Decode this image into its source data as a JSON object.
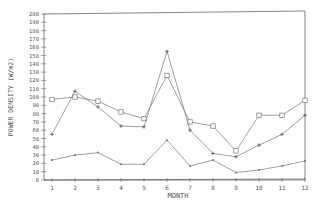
{
  "chart_data": {
    "type": "line",
    "title": "",
    "xlabel": "MONTH",
    "ylabel": "POWER DENSITY (W/m2)",
    "x": [
      1,
      2,
      3,
      4,
      5,
      6,
      7,
      8,
      9,
      10,
      11,
      12
    ],
    "xlim": [
      1,
      12
    ],
    "ylim": [
      0,
      200
    ],
    "yticks": [
      0,
      10,
      20,
      30,
      40,
      50,
      60,
      70,
      80,
      90,
      100,
      110,
      120,
      130,
      140,
      150,
      160,
      170,
      180,
      190,
      200
    ],
    "xticks": [
      1,
      2,
      3,
      4,
      5,
      6,
      7,
      8,
      9,
      10,
      11,
      12
    ],
    "grid": false,
    "legend": null,
    "series": [
      {
        "name": "Series A (square markers)",
        "marker": "square",
        "values": [
          97,
          100,
          95,
          82,
          74,
          126,
          70,
          65,
          35,
          78,
          78,
          96
        ]
      },
      {
        "name": "Series B (plus/triangle markers)",
        "marker": "plus",
        "values": [
          55,
          107,
          88,
          65,
          64,
          155,
          60,
          32,
          28,
          42,
          55,
          78
        ]
      },
      {
        "name": "Series C (small markers)",
        "marker": "dot",
        "values": [
          24,
          30,
          33,
          19,
          19,
          48,
          17,
          24,
          9,
          12,
          17,
          23
        ]
      }
    ]
  },
  "colors": {
    "line": "#888888",
    "axis": "#666666",
    "text": "#555555"
  }
}
